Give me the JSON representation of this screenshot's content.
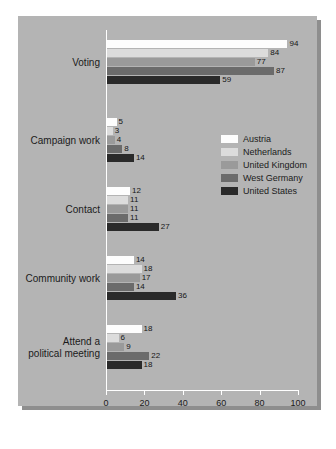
{
  "chart_data": {
    "type": "bar",
    "orientation": "horizontal",
    "title": "",
    "xlabel": "",
    "ylabel": "",
    "xlim": [
      0,
      100
    ],
    "xticks": [
      "0",
      "20",
      "40",
      "60",
      "80",
      "100"
    ],
    "grid": false,
    "legend_position": "center-right",
    "categories": [
      "Voting",
      "Campaign work",
      "Contact",
      "Community work",
      "Attend a political meeting"
    ],
    "series": [
      {
        "name": "Austria",
        "color": "#fdfdfd",
        "values": [
          94,
          5,
          12,
          14,
          18
        ]
      },
      {
        "name": "Netherlands",
        "color": "#dcdcdc",
        "values": [
          84,
          3,
          11,
          18,
          6
        ]
      },
      {
        "name": "United Kingdom",
        "color": "#9a9a9a",
        "values": [
          77,
          4,
          11,
          17,
          9
        ]
      },
      {
        "name": "West Germany",
        "color": "#6b6b6b",
        "values": [
          87,
          8,
          11,
          14,
          22
        ]
      },
      {
        "name": "United States",
        "color": "#2a2a2a",
        "values": [
          59,
          14,
          27,
          36,
          18
        ]
      }
    ]
  },
  "axis": {
    "ticks": [
      {
        "label": "0",
        "value": 0
      },
      {
        "label": "20",
        "value": 20
      },
      {
        "label": "40",
        "value": 40
      },
      {
        "label": "60",
        "value": 60
      },
      {
        "label": "80",
        "value": 80
      },
      {
        "label": "100",
        "value": 100
      }
    ]
  },
  "category_labels": [
    {
      "lines": [
        "Voting"
      ]
    },
    {
      "lines": [
        "Campaign work"
      ]
    },
    {
      "lines": [
        "Contact"
      ]
    },
    {
      "lines": [
        "Community work"
      ]
    },
    {
      "lines": [
        "Attend a",
        "political meeting"
      ]
    }
  ],
  "colors": {
    "page_background": "#ffffff",
    "panel_background": "#b4b4b4",
    "panel_shadow": "#8e8e8e",
    "axis_line": "#ffffff",
    "text": "#1b1b1b"
  }
}
